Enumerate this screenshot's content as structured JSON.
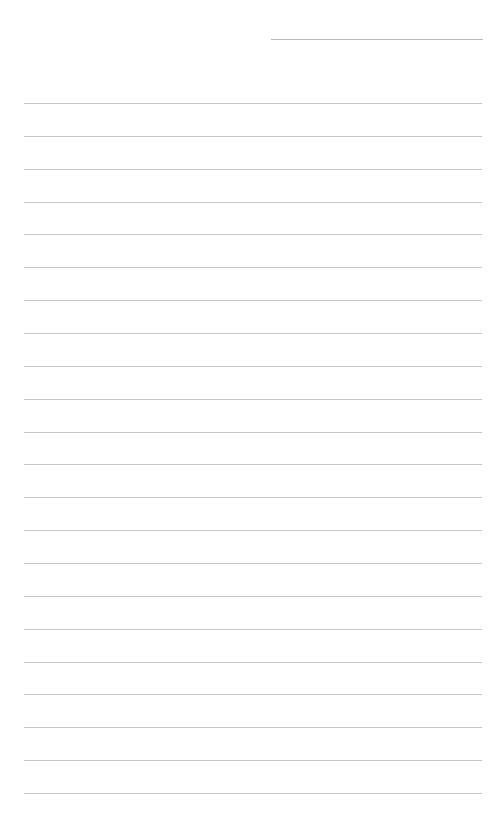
{
  "document": {
    "type": "lined-paper",
    "background_color": "#ffffff",
    "line_color": "#c6c6c6",
    "header_line": {
      "label": "",
      "color": "#b8b8b8"
    },
    "ruled_lines": {
      "count": 22,
      "first_y": 103,
      "spacing": 32.86,
      "text": [
        "",
        "",
        "",
        "",
        "",
        "",
        "",
        "",
        "",
        "",
        "",
        "",
        "",
        "",
        "",
        "",
        "",
        "",
        "",
        "",
        "",
        ""
      ]
    }
  }
}
